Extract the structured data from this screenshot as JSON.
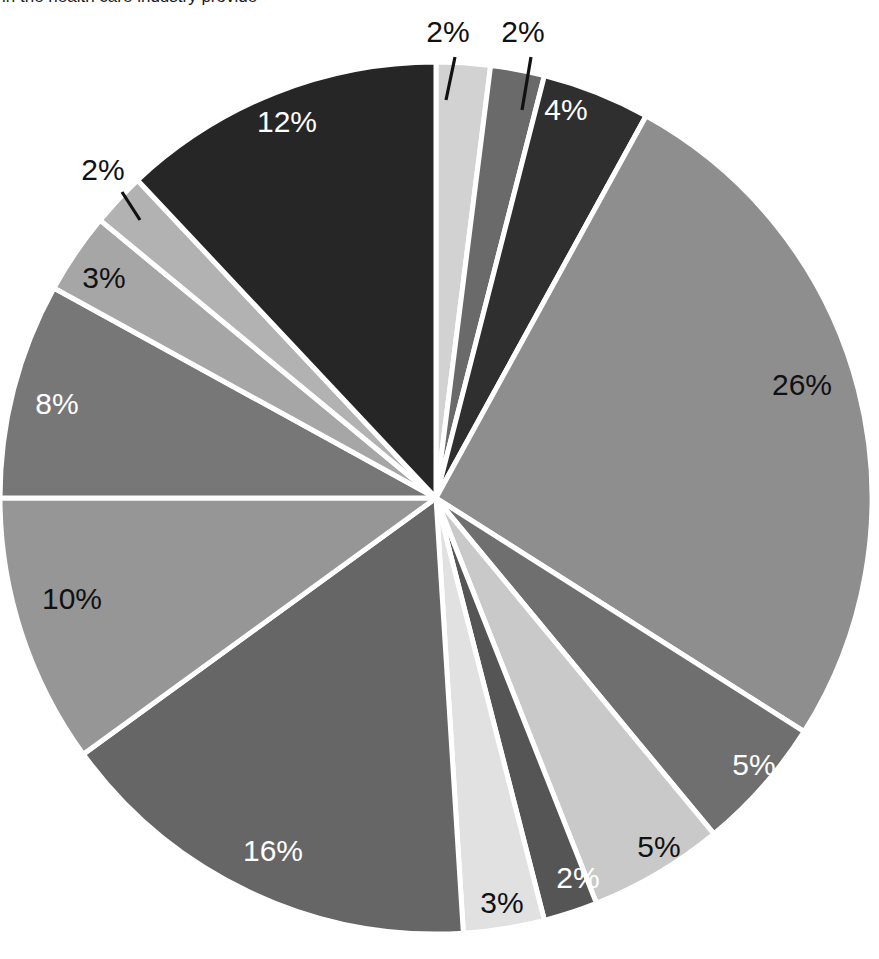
{
  "caption": {
    "text": "in the health care industry provide"
  },
  "chart_data": {
    "type": "pie",
    "title": "",
    "subtitle": "",
    "xlabel": "",
    "ylabel": "",
    "grid": false,
    "legend_position": "none",
    "value_unit": "%",
    "total": 100,
    "start_angle_deg": 0,
    "direction": "clockwise",
    "center": {
      "x": 436,
      "y": 498
    },
    "radius": 436,
    "separator_color": "#ffffff",
    "separator_width": 5,
    "labels": [
      "2%",
      "2%",
      "4%",
      "26%",
      "5%",
      "5%",
      "2%",
      "3%",
      "16%",
      "10%",
      "8%",
      "3%",
      "2%",
      "12%"
    ],
    "values": [
      2,
      2,
      4,
      26,
      5,
      5,
      2,
      3,
      16,
      10,
      8,
      3,
      2,
      12
    ],
    "slices": [
      {
        "label": "2%",
        "value": 2,
        "color": "#d2d2d2",
        "text_color": "#111111",
        "label_placement": "outside",
        "label_x": 448,
        "label_y": 42,
        "leader": {
          "x1": 455,
          "y1": 57,
          "x2": 446,
          "y2": 100
        }
      },
      {
        "label": "2%",
        "value": 2,
        "color": "#6a6a6a",
        "text_color": "#111111",
        "label_placement": "outside",
        "label_x": 523,
        "label_y": 42,
        "leader": {
          "x1": 531,
          "y1": 57,
          "x2": 522,
          "y2": 110
        }
      },
      {
        "label": "4%",
        "value": 4,
        "color": "#2f2f2f",
        "text_color": "#ffffff",
        "label_placement": "inside",
        "label_x": 566,
        "label_y": 120,
        "leader": null
      },
      {
        "label": "26%",
        "value": 26,
        "color": "#8e8e8e",
        "text_color": "#111111",
        "label_placement": "inside",
        "label_x": 802,
        "label_y": 395,
        "leader": null
      },
      {
        "label": "5%",
        "value": 5,
        "color": "#6f6f6f",
        "text_color": "#ffffff",
        "label_placement": "inside",
        "label_x": 754,
        "label_y": 775,
        "leader": null
      },
      {
        "label": "5%",
        "value": 5,
        "color": "#c9c9c9",
        "text_color": "#111111",
        "label_placement": "inside",
        "label_x": 659,
        "label_y": 857,
        "leader": null
      },
      {
        "label": "2%",
        "value": 2,
        "color": "#555555",
        "text_color": "#ffffff",
        "label_placement": "inside",
        "label_x": 578,
        "label_y": 888,
        "leader": null
      },
      {
        "label": "3%",
        "value": 3,
        "color": "#e1e1e1",
        "text_color": "#111111",
        "label_placement": "inside",
        "label_x": 502,
        "label_y": 913,
        "leader": null
      },
      {
        "label": "16%",
        "value": 16,
        "color": "#666666",
        "text_color": "#ffffff",
        "label_placement": "inside",
        "label_x": 273,
        "label_y": 861,
        "leader": null
      },
      {
        "label": "10%",
        "value": 10,
        "color": "#969696",
        "text_color": "#111111",
        "label_placement": "inside",
        "label_x": 72,
        "label_y": 609,
        "leader": null
      },
      {
        "label": "8%",
        "value": 8,
        "color": "#777777",
        "text_color": "#ffffff",
        "label_placement": "inside",
        "label_x": 57,
        "label_y": 414,
        "leader": null
      },
      {
        "label": "3%",
        "value": 3,
        "color": "#a6a6a6",
        "text_color": "#111111",
        "label_placement": "inside",
        "label_x": 104,
        "label_y": 288,
        "leader": null
      },
      {
        "label": "2%",
        "value": 2,
        "color": "#b2b2b2",
        "text_color": "#111111",
        "label_placement": "outside",
        "label_x": 103,
        "label_y": 180,
        "leader": {
          "x1": 122,
          "y1": 192,
          "x2": 140,
          "y2": 220
        }
      },
      {
        "label": "12%",
        "value": 12,
        "color": "#262626",
        "text_color": "#ffffff",
        "label_placement": "inside",
        "label_x": 287,
        "label_y": 132,
        "leader": null
      }
    ]
  }
}
